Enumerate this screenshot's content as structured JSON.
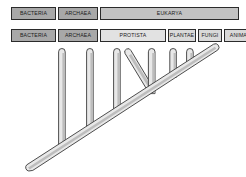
{
  "diagram": {
    "background_color": "#ffffff",
    "line_color": "#3a3a3a",
    "limb_fill_color": "#e8e8e8"
  },
  "domain_row": {
    "name": "domains",
    "cells": [
      {
        "label": "BACTERIA",
        "shade": "shade-dark",
        "width": 45
      },
      {
        "label": "ARCHAEA",
        "shade": "shade-dark",
        "width": 40
      },
      {
        "label": "EUKARYA",
        "shade": "shade-mid",
        "width": 139
      }
    ]
  },
  "kingdom_row": {
    "name": "kingdoms",
    "cells": [
      {
        "label": "BACTERIA",
        "shade": "shade-dark",
        "width": 45
      },
      {
        "label": "ARCHAEA",
        "shade": "shade-dark",
        "width": 40
      },
      {
        "label": "PROTISTA",
        "shade": "shade-pale",
        "width": 66
      },
      {
        "label": "PLANTAE",
        "shade": "shade-light",
        "width": 28
      },
      {
        "label": "FUNGI",
        "shade": "shade-light",
        "width": 24
      },
      {
        "label": "ANIMALIA",
        "shade": "shade-light",
        "width": 37
      }
    ]
  },
  "chart_data": {
    "type": "diagram",
    "subtype": "phylogenetic-tree",
    "trunk": {
      "base_x": 30,
      "base_y": 168,
      "tip_x": 216,
      "tip_y": 47
    },
    "branches": [
      {
        "id": "branch-1",
        "tip_x": 48,
        "tip_y": 48,
        "base_x": 62,
        "base_y": 147,
        "kind": "vertical"
      },
      {
        "id": "branch-2",
        "tip_x": 76,
        "tip_y": 48,
        "base_x": 90,
        "base_y": 129,
        "kind": "vertical"
      },
      {
        "id": "branch-3",
        "tip_x": 103,
        "tip_y": 48,
        "base_x": 117,
        "base_y": 111,
        "kind": "vertical"
      },
      {
        "id": "branch-4",
        "tip_x": 128,
        "tip_y": 48,
        "base_x": 152,
        "base_y": 92,
        "kind": "diagonal"
      },
      {
        "id": "branch-5",
        "tip_x": 152,
        "tip_y": 48,
        "base_x": 152,
        "base_y": 92,
        "kind": "vertical"
      },
      {
        "id": "branch-6",
        "tip_x": 173,
        "tip_y": 48,
        "base_x": 177,
        "base_y": 76,
        "kind": "vertical"
      },
      {
        "id": "branch-7",
        "tip_x": 190,
        "tip_y": 48,
        "base_x": 193,
        "base_y": 65,
        "kind": "vertical"
      }
    ]
  }
}
